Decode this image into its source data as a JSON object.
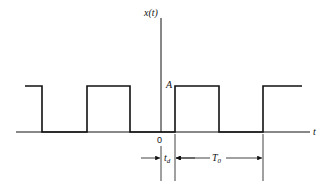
{
  "diagram": {
    "type": "periodic rectangular pulse train",
    "y_axis_label": "x(t)",
    "x_axis_label": "t",
    "origin_label": "0",
    "amplitude_label": "A",
    "delay_label": "t",
    "delay_subscript": "d",
    "period_label": "T",
    "period_subscript": "0",
    "colors": {
      "line": "#111111",
      "background": "#ffffff"
    }
  }
}
